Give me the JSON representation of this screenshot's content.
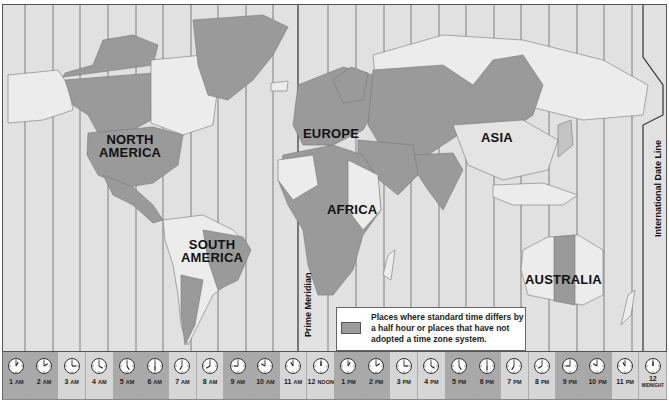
{
  "map": {
    "continent_labels": [
      {
        "id": "north-america",
        "text": [
          "NORTH",
          "AMERICA"
        ],
        "x": 96,
        "y": 133
      },
      {
        "id": "south-america",
        "text": [
          "SOUTH",
          "AMERICA"
        ],
        "x": 178,
        "y": 236
      },
      {
        "id": "europe",
        "text": [
          "EUROPE"
        ],
        "x": 302,
        "y": 124
      },
      {
        "id": "africa",
        "text": [
          "AFRICA"
        ],
        "x": 326,
        "y": 202
      },
      {
        "id": "asia",
        "text": [
          "ASIA"
        ],
        "x": 478,
        "y": 130
      },
      {
        "id": "australia",
        "text": [
          "AUSTRALIA"
        ],
        "x": 524,
        "y": 269
      }
    ],
    "prime_meridian_label": "Prime Meridian",
    "date_line_label": "International Date Line",
    "colors": {
      "ocean": "#e1e1e1",
      "land_standard": "#eaeaea",
      "land_half_hour": "#9a9a9a",
      "land_medium": "#c4c4c4",
      "zone_line": "#555555"
    }
  },
  "legend": {
    "text": "Places where standard time differs by a half hour or places that have not adopted a time zone system.",
    "swatch_color": "#9a9a9a"
  },
  "clock_strip": {
    "hours": [
      {
        "num": "1",
        "suffix": "AM",
        "h": 1,
        "shade": "dark"
      },
      {
        "num": "2",
        "suffix": "AM",
        "h": 2,
        "shade": "dark"
      },
      {
        "num": "3",
        "suffix": "AM",
        "h": 3,
        "shade": "light"
      },
      {
        "num": "4",
        "suffix": "AM",
        "h": 4,
        "shade": "light"
      },
      {
        "num": "5",
        "suffix": "AM",
        "h": 5,
        "shade": "dark"
      },
      {
        "num": "6",
        "suffix": "AM",
        "h": 6,
        "shade": "dark"
      },
      {
        "num": "7",
        "suffix": "AM",
        "h": 7,
        "shade": "light"
      },
      {
        "num": "8",
        "suffix": "AM",
        "h": 8,
        "shade": "light"
      },
      {
        "num": "9",
        "suffix": "AM",
        "h": 9,
        "shade": "dark"
      },
      {
        "num": "10",
        "suffix": "AM",
        "h": 10,
        "shade": "dark"
      },
      {
        "num": "11",
        "suffix": "AM",
        "h": 11,
        "shade": "light"
      },
      {
        "num": "12",
        "suffix": "NOON",
        "h": 12,
        "shade": "light"
      },
      {
        "num": "1",
        "suffix": "PM",
        "h": 1,
        "shade": "dark"
      },
      {
        "num": "2",
        "suffix": "PM",
        "h": 2,
        "shade": "dark"
      },
      {
        "num": "3",
        "suffix": "PM",
        "h": 3,
        "shade": "light"
      },
      {
        "num": "4",
        "suffix": "PM",
        "h": 4,
        "shade": "light"
      },
      {
        "num": "5",
        "suffix": "PM",
        "h": 5,
        "shade": "dark"
      },
      {
        "num": "6",
        "suffix": "PM",
        "h": 6,
        "shade": "dark"
      },
      {
        "num": "7",
        "suffix": "PM",
        "h": 7,
        "shade": "light"
      },
      {
        "num": "8",
        "suffix": "PM",
        "h": 8,
        "shade": "light"
      },
      {
        "num": "9",
        "suffix": "PM",
        "h": 9,
        "shade": "dark"
      },
      {
        "num": "10",
        "suffix": "PM",
        "h": 10,
        "shade": "dark"
      },
      {
        "num": "11",
        "suffix": "PM",
        "h": 11,
        "shade": "light"
      },
      {
        "num": "12",
        "suffix": "MIDNIGHT",
        "h": 12,
        "shade": "light"
      }
    ]
  }
}
